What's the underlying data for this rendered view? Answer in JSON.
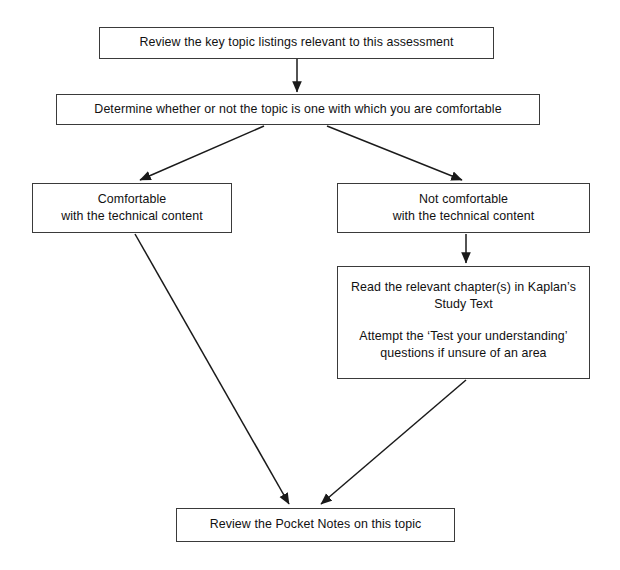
{
  "diagram": {
    "style": {
      "background": "#ffffff",
      "box_border": "#3a3a3a",
      "connector": "#1a1a1a",
      "text": "#111111"
    },
    "nodes": [
      {
        "id": "review-topics",
        "lines": [
          "Review the key topic listings relevant to this assessment"
        ]
      },
      {
        "id": "determine-comfort",
        "lines": [
          "Determine whether or not the topic is one with which you are comfortable"
        ]
      },
      {
        "id": "comfortable",
        "lines": [
          "Comfortable",
          "with the technical content"
        ]
      },
      {
        "id": "not-comfortable",
        "lines": [
          "Not comfortable",
          "with the technical content"
        ]
      },
      {
        "id": "read-study-text",
        "lines": [
          "Read the relevant chapter(s) in Kaplan’s",
          "Study Text",
          "",
          "Attempt the ‘Test your understanding’",
          "questions if unsure of an area"
        ]
      },
      {
        "id": "pocket-notes",
        "lines": [
          "Review the Pocket Notes on this topic"
        ]
      }
    ],
    "connectors": [
      {
        "id": "review-to-determine",
        "from": "review-topics",
        "to": "determine-comfort",
        "shape": "vertical-arrow"
      },
      {
        "id": "determine-to-comfortable",
        "from": "determine-comfort",
        "to": "comfortable",
        "shape": "diagonal-arrow-left"
      },
      {
        "id": "determine-to-notcomfortable",
        "from": "determine-comfort",
        "to": "not-comfortable",
        "shape": "diagonal-arrow-right"
      },
      {
        "id": "notcomfortable-to-read",
        "from": "not-comfortable",
        "to": "read-study-text",
        "shape": "vertical-arrow"
      },
      {
        "id": "comfortable-to-pocket",
        "from": "comfortable",
        "to": "pocket-notes",
        "shape": "diagonal-arrow-down-right"
      },
      {
        "id": "read-to-pocket",
        "from": "read-study-text",
        "to": "pocket-notes",
        "shape": "diagonal-arrow-down-left"
      }
    ]
  }
}
